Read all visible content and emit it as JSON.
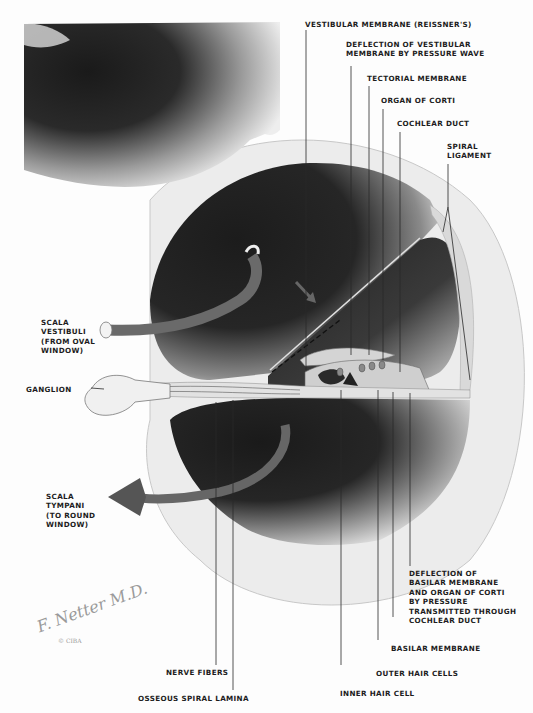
{
  "diagram": {
    "colors": {
      "scala_dark": "#1e1e1e",
      "tube": "#6a6a6a",
      "bone_light": "#e6e6e6",
      "leader_line": "#2a2a2a",
      "text": "#1c1c1c"
    },
    "labels": {
      "vestibular_membrane": "VESTIBULAR MEMBRANE (REISSNER'S)",
      "deflection_vestibular": "DEFLECTION OF VESTIBULAR\nMEMBRANE BY PRESSURE WAVE",
      "tectorial_membrane": "TECTORIAL MEMBRANE",
      "organ_of_corti": "ORGAN OF CORTI",
      "cochlear_duct": "COCHLEAR DUCT",
      "spiral_ligament": "SPIRAL\nLIGAMENT",
      "scala_vestibuli": "SCALA\nVESTIBULI\n(FROM OVAL\nWINDOW)",
      "ganglion": "GANGLION",
      "scala_tympani": "SCALA\nTYMPANI\n(TO ROUND\nWINDOW)",
      "deflection_basilar": "DEFLECTION OF\nBASILAR MEMBRANE\nAND ORGAN OF CORTI\nBY PRESSURE\nTRANSMITTED THROUGH\nCOCHLEAR DUCT",
      "basilar_membrane": "BASILAR MEMBRANE",
      "outer_hair_cells": "OUTER HAIR CELLS",
      "inner_hair_cell": "INNER HAIR CELL",
      "nerve_fibers": "NERVE FIBERS",
      "osseous_spiral_lamina": "OSSEOUS SPIRAL LAMINA"
    },
    "signature": {
      "artist": "F. Netter M.D.",
      "credit": "© CIBA"
    }
  }
}
